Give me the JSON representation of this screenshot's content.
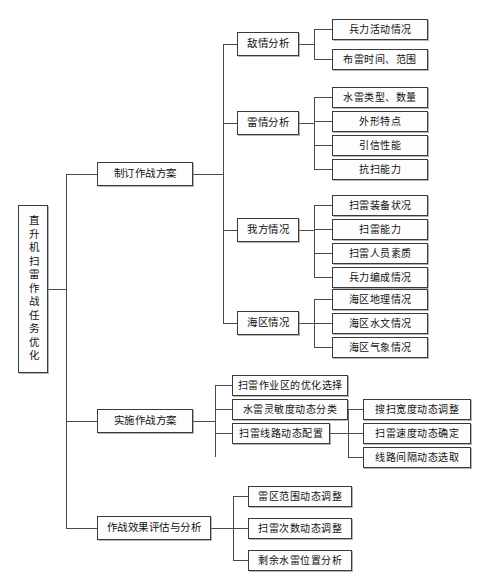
{
  "diagram": {
    "type": "tree-hierarchy",
    "title_node": "直升机扫雷作战任务优化",
    "root": {
      "label": "直升机扫雷作战任务优化",
      "orientation": "vertical-text"
    },
    "level2": [
      {
        "label": "制订作战方案"
      },
      {
        "label": "实施作战方案"
      },
      {
        "label": "作战效果评估与分析"
      }
    ],
    "level3": [
      {
        "label": "敌情分析"
      },
      {
        "label": "雷情分析"
      },
      {
        "label": "我方情况"
      },
      {
        "label": "海区情况"
      },
      {
        "label": "扫雷作业区的优化选择"
      },
      {
        "label": "水雷灵敏度动态分类"
      },
      {
        "label": "扫雷线路动态配置"
      },
      {
        "label": "雷区范围动态调整"
      },
      {
        "label": "扫雷次数动态调整"
      },
      {
        "label": "剩余水雷位置分析"
      }
    ],
    "enemy_leaves": [
      {
        "label": "兵力活动情况"
      },
      {
        "label": "布雷时间、范围"
      }
    ],
    "mine_leaves": [
      {
        "label": "水雷类型、数量"
      },
      {
        "label": "外形特点"
      },
      {
        "label": "引信性能"
      },
      {
        "label": "抗扫能力"
      }
    ],
    "own_leaves": [
      {
        "label": "扫雷装备状况"
      },
      {
        "label": "扫雷能力"
      },
      {
        "label": "扫雷人员素质"
      },
      {
        "label": "兵力编成情况"
      }
    ],
    "sea_leaves": [
      {
        "label": "海区地理情况"
      },
      {
        "label": "海区水文情况"
      },
      {
        "label": "海区气象情况"
      }
    ],
    "route_leaves": [
      {
        "label": "搜扫宽度动态调整"
      },
      {
        "label": "扫雷速度动态确定"
      },
      {
        "label": "线路间隔动态选取"
      }
    ],
    "colors": {
      "box_border": "#3a3a3a",
      "box_fill": "#fdfdfd",
      "line": "#4a4a4a",
      "text": "#111111",
      "background": "#ffffff"
    }
  }
}
